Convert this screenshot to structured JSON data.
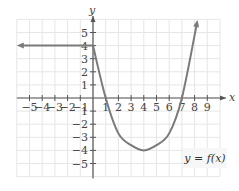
{
  "chart_data": {
    "type": "line",
    "title": "",
    "xlabel": "x",
    "ylabel": "y",
    "xlim": [
      -6,
      10
    ],
    "ylim": [
      -6,
      6
    ],
    "grid": true,
    "x_ticks": [
      -5,
      -4,
      -3,
      -2,
      -1,
      1,
      2,
      3,
      4,
      5,
      6,
      7,
      8,
      9
    ],
    "x_tick_labels": [
      "−5",
      "−4",
      "−3",
      "−2",
      "−1",
      "1",
      "2",
      "3",
      "4",
      "5",
      "6",
      "7",
      "8",
      "9"
    ],
    "y_ticks": [
      5,
      4,
      3,
      2,
      1,
      -1,
      -2,
      -3,
      -4,
      -5
    ],
    "y_tick_labels": [
      "5",
      "4",
      "3",
      "2",
      "1",
      "1",
      "−2",
      "−3",
      "−4",
      "−5"
    ],
    "series": [
      {
        "name": "y = f(x)",
        "color": "#7a7a7a",
        "description": "Horizontal ray y=4 for x<0 (arrow pointing left), then parabola-like curve through (1,0), vertex (4,-4), (7,0), continuing upward with arrow",
        "points": [
          {
            "x": -6,
            "y": 4
          },
          {
            "x": 0,
            "y": 4
          },
          {
            "x": 1,
            "y": 0
          },
          {
            "x": 2,
            "y": -2.7
          },
          {
            "x": 3,
            "y": -3.6
          },
          {
            "x": 4,
            "y": -4
          },
          {
            "x": 5,
            "y": -3.6
          },
          {
            "x": 6,
            "y": -2.7
          },
          {
            "x": 7,
            "y": 0
          },
          {
            "x": 8.2,
            "y": 5.8
          }
        ]
      }
    ],
    "annotations": [
      {
        "text": "y = f(x)",
        "x": 7.5,
        "y": -3.5
      }
    ],
    "colors": {
      "grid": "#e6e6e6",
      "axis": "#555555",
      "curve": "#7a7a7a",
      "text": "#444444"
    }
  },
  "labels": {
    "x_axis": "x",
    "y_axis": "y",
    "function_label": "y = f(x)"
  }
}
